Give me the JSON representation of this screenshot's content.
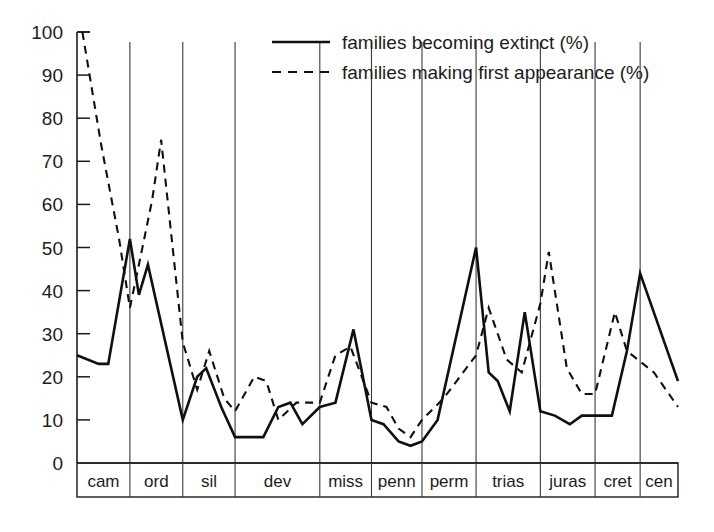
{
  "chart_data": {
    "type": "line",
    "title": "",
    "subtitle": "",
    "xlabel": "",
    "ylabel": "",
    "ylim": [
      0,
      100
    ],
    "y_ticks": [
      0,
      10,
      20,
      30,
      40,
      50,
      60,
      70,
      80,
      90,
      100
    ],
    "y_tick_labels": [
      "0",
      "10",
      "20",
      "30",
      "40",
      "50",
      "60",
      "70",
      "80",
      "90",
      "100"
    ],
    "grid": false,
    "legend_position": "top-center",
    "categories": [
      "cam",
      "ord",
      "sil",
      "dev",
      "miss",
      "penn",
      "perm",
      "trias",
      "juras",
      "cret",
      "cen"
    ],
    "category_labels": [
      "cam",
      "ord",
      "sil",
      "dev",
      "miss",
      "penn",
      "perm",
      "trias",
      "juras",
      "cret",
      "cen"
    ],
    "period_boundaries_pct": [
      0,
      8.8,
      17.6,
      26.3,
      40.4,
      49.0,
      57.4,
      66.4,
      77.1,
      86.2,
      93.7,
      100
    ],
    "series": [
      {
        "name": "families becoming extinct (%)",
        "style": "solid",
        "points": [
          {
            "x": 0.0,
            "y": 25
          },
          {
            "x": 3.6,
            "y": 23
          },
          {
            "x": 5.2,
            "y": 23
          },
          {
            "x": 8.8,
            "y": 52
          },
          {
            "x": 10.3,
            "y": 39
          },
          {
            "x": 11.8,
            "y": 46
          },
          {
            "x": 17.6,
            "y": 10
          },
          {
            "x": 20.0,
            "y": 20
          },
          {
            "x": 21.5,
            "y": 22
          },
          {
            "x": 24.0,
            "y": 13
          },
          {
            "x": 26.3,
            "y": 6
          },
          {
            "x": 31.0,
            "y": 6
          },
          {
            "x": 33.5,
            "y": 13
          },
          {
            "x": 35.5,
            "y": 14
          },
          {
            "x": 37.5,
            "y": 9
          },
          {
            "x": 40.4,
            "y": 13
          },
          {
            "x": 43.0,
            "y": 14
          },
          {
            "x": 46.0,
            "y": 31
          },
          {
            "x": 49.0,
            "y": 10
          },
          {
            "x": 51.0,
            "y": 9
          },
          {
            "x": 53.5,
            "y": 5
          },
          {
            "x": 55.5,
            "y": 4
          },
          {
            "x": 57.4,
            "y": 5
          },
          {
            "x": 60.0,
            "y": 10
          },
          {
            "x": 66.4,
            "y": 50
          },
          {
            "x": 68.5,
            "y": 21
          },
          {
            "x": 70.0,
            "y": 19
          },
          {
            "x": 72.0,
            "y": 12
          },
          {
            "x": 74.5,
            "y": 35
          },
          {
            "x": 77.1,
            "y": 12
          },
          {
            "x": 79.5,
            "y": 11
          },
          {
            "x": 82.0,
            "y": 9
          },
          {
            "x": 84.0,
            "y": 11
          },
          {
            "x": 86.2,
            "y": 11
          },
          {
            "x": 89.0,
            "y": 11
          },
          {
            "x": 91.5,
            "y": 26
          },
          {
            "x": 93.7,
            "y": 44
          },
          {
            "x": 100.0,
            "y": 19
          }
        ]
      },
      {
        "name": "families making first appearance (%)",
        "style": "dashed",
        "points": [
          {
            "x": 0.9,
            "y": 100
          },
          {
            "x": 4.0,
            "y": 74
          },
          {
            "x": 7.0,
            "y": 52
          },
          {
            "x": 8.8,
            "y": 36
          },
          {
            "x": 10.3,
            "y": 46
          },
          {
            "x": 12.5,
            "y": 61
          },
          {
            "x": 14.0,
            "y": 75
          },
          {
            "x": 17.6,
            "y": 28
          },
          {
            "x": 20.0,
            "y": 17
          },
          {
            "x": 22.0,
            "y": 26
          },
          {
            "x": 24.5,
            "y": 15
          },
          {
            "x": 26.3,
            "y": 12
          },
          {
            "x": 29.5,
            "y": 20
          },
          {
            "x": 31.5,
            "y": 19
          },
          {
            "x": 33.5,
            "y": 10
          },
          {
            "x": 36.5,
            "y": 14
          },
          {
            "x": 40.4,
            "y": 14
          },
          {
            "x": 43.0,
            "y": 25
          },
          {
            "x": 45.5,
            "y": 27
          },
          {
            "x": 49.0,
            "y": 14
          },
          {
            "x": 51.5,
            "y": 13
          },
          {
            "x": 53.5,
            "y": 8
          },
          {
            "x": 55.5,
            "y": 6
          },
          {
            "x": 57.4,
            "y": 10
          },
          {
            "x": 61.0,
            "y": 15
          },
          {
            "x": 66.4,
            "y": 25
          },
          {
            "x": 68.5,
            "y": 36
          },
          {
            "x": 71.5,
            "y": 24
          },
          {
            "x": 74.0,
            "y": 21
          },
          {
            "x": 77.1,
            "y": 37
          },
          {
            "x": 78.5,
            "y": 49
          },
          {
            "x": 81.5,
            "y": 22
          },
          {
            "x": 84.0,
            "y": 16
          },
          {
            "x": 86.2,
            "y": 16
          },
          {
            "x": 89.5,
            "y": 35
          },
          {
            "x": 91.5,
            "y": 26
          },
          {
            "x": 96.0,
            "y": 21
          },
          {
            "x": 100.0,
            "y": 13
          }
        ]
      }
    ],
    "legend": [
      {
        "label": "families becoming extinct (%)",
        "style": "solid"
      },
      {
        "label": "families making first appearance (%)",
        "style": "dashed"
      }
    ]
  }
}
